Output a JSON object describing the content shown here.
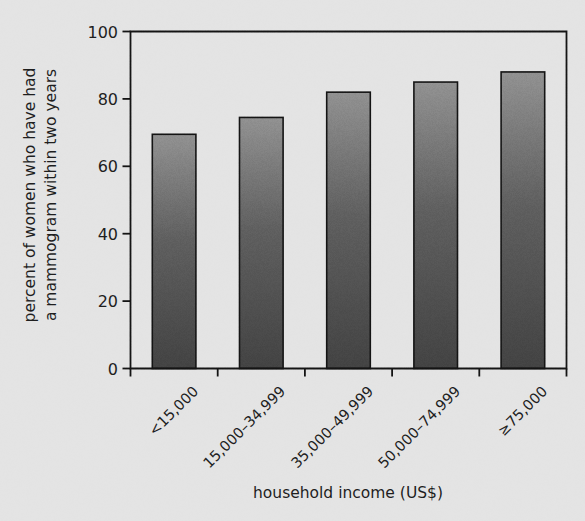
{
  "chart_data": {
    "type": "bar",
    "title": "",
    "subtitle": "",
    "xlabel": "household income (US$)",
    "ylabel": "percent of women who have had a mammogram within two years",
    "ylabel_line1": "percent of women who have had",
    "ylabel_line2": "a mammogram within two years",
    "categories": [
      "<15,000",
      "15,000–34,999",
      "35,000–49,999",
      "50,000–74,999",
      "≥75,000"
    ],
    "values": [
      69.5,
      74.5,
      82,
      85,
      88
    ],
    "ylim": [
      0,
      100
    ],
    "yticks": [
      0,
      20,
      40,
      60,
      80,
      100
    ],
    "ytick_labels": [
      "0",
      "20",
      "40",
      "60",
      "80",
      "100"
    ],
    "grid": false,
    "legend": null,
    "legend_position": "none",
    "annotations": [],
    "bar_style": {
      "fill_top": "#8f8f8f",
      "fill_bottom": "#464646",
      "edge": "#141414"
    },
    "colors": {
      "background": "#e4e4e4",
      "axis": "#141414",
      "text": "#1e1e1e"
    }
  }
}
